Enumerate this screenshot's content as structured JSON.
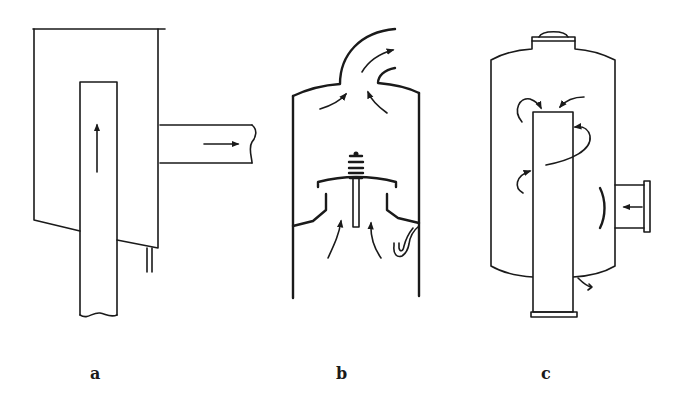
{
  "figure": {
    "panels": [
      {
        "id": "a",
        "label": "a",
        "description": "Vertical inlet pipe with upward flow inside a box vessel, side outlet pipe with rightward flow, drain pipe at bottom"
      },
      {
        "id": "b",
        "label": "b",
        "description": "Vertical column with spring-loaded valve plate; flow enters from below through valve, exits through curved top outlet"
      },
      {
        "id": "c",
        "label": "c",
        "description": "Cylindrical vessel with domed cap, central standpipe, tangential side inlet with baffle, swirling flow arrows, bottom drain"
      }
    ],
    "colors": {
      "line": "#1a1a1a",
      "background": "#ffffff"
    }
  }
}
